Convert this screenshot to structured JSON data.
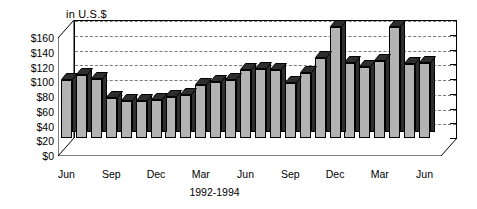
{
  "chart_data": {
    "type": "bar",
    "title": "",
    "axis_note": "in U.S.$",
    "xlabel": "1992-1994",
    "ylabel": "",
    "ylim": [
      0,
      160
    ],
    "ytick_step": 20,
    "grid": true,
    "legend": "none",
    "style": "3d-column",
    "categories": [
      "Jun 1992",
      "Jul 1992",
      "Aug 1992",
      "Sep 1992",
      "Oct 1992",
      "Nov 1992",
      "Dec 1992",
      "Jan 1993",
      "Feb 1993",
      "Mar 1993",
      "Apr 1993",
      "May 1993",
      "Jun 1993",
      "Jul 1993",
      "Aug 1993",
      "Sep 1993",
      "Oct 1993",
      "Nov 1993",
      "Dec 1993",
      "Jan 1994",
      "Feb 1994",
      "Mar 1994",
      "Apr 1994",
      "May 1994",
      "Jun 1994"
    ],
    "values": [
      78,
      86,
      80,
      54,
      50,
      50,
      52,
      56,
      58,
      72,
      76,
      78,
      92,
      94,
      92,
      74,
      88,
      108,
      150,
      102,
      96,
      104,
      150,
      100,
      102
    ],
    "yticklabels": [
      "$0",
      "$20",
      "$40",
      "$60",
      "$80",
      "$100",
      "$120",
      "$140",
      "$160"
    ],
    "yticks": [
      0,
      20,
      40,
      60,
      80,
      100,
      120,
      140,
      160
    ],
    "xticklabels": [
      "Jun",
      "Sep",
      "Dec",
      "Mar",
      "Jun",
      "Sep",
      "Dec",
      "Mar",
      "Jun"
    ],
    "xtick_indices": [
      0,
      3,
      6,
      9,
      12,
      15,
      18,
      21,
      24
    ],
    "colors": {
      "bar_front": "#b3b3b3",
      "bar_side": "#2e2e2e",
      "bar_top": "#2e2e2e",
      "gridline": "#7a7a7a",
      "axis": "#000000",
      "background": "#ffffff"
    }
  }
}
